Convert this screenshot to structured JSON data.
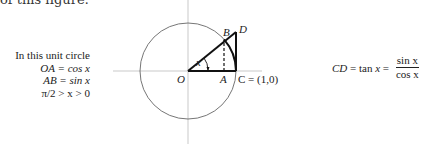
{
  "top_partial_text": "of this figure:",
  "caption": {
    "lines": [
      "In this unit circle",
      "OA = cos x",
      "AB = sin x",
      "π/2 > x > 0"
    ]
  },
  "diagram": {
    "points": {
      "O": "O",
      "A": "A",
      "B": "B",
      "C": "C = (1,0)",
      "D": "D"
    },
    "angle_label": "x"
  },
  "formula": {
    "lhs": "CD",
    "eq1": " = tan ",
    "var": "x",
    "eq2": " = ",
    "numerator": "sin x",
    "denominator": "cos x"
  }
}
